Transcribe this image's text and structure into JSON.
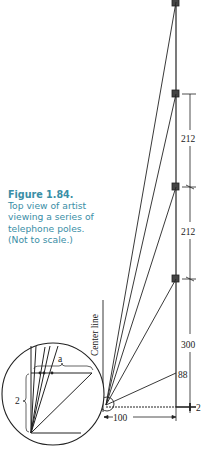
{
  "caption": {
    "title": "Figure 1.84.",
    "text": "Top view of artist viewing a series of telephone poles. (Not to scale.)"
  },
  "diagram": {
    "center_line_label": "Center line",
    "dimensions": {
      "pole_spacing_upper": "212",
      "pole_spacing_middle": "212",
      "first_pole_distance": "300",
      "angle_point_label": "88",
      "baseline_offset": "2",
      "horizontal_distance": "100"
    },
    "inset": {
      "label_a": "a",
      "label_2": "2"
    },
    "colors": {
      "caption": "#3a8ea6",
      "lines": "#222222",
      "pole_fill": "#444444"
    }
  }
}
